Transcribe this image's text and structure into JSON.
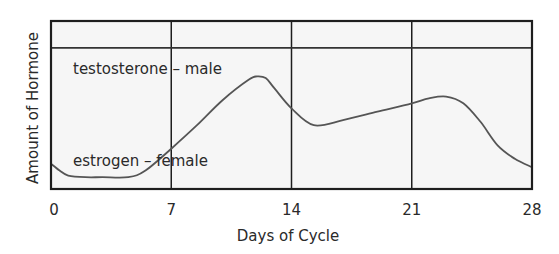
{
  "chart_data": {
    "type": "line",
    "title": "",
    "xlabel": "Days of Cycle",
    "ylabel": "Amount of Hormone",
    "xlim": [
      0,
      28
    ],
    "ylim": [
      0,
      100
    ],
    "x_ticks": [
      0,
      7,
      14,
      21,
      28
    ],
    "x_tick_labels": [
      "0",
      "7",
      "14",
      "21",
      "28"
    ],
    "y_ticks": [],
    "grid": {
      "vertical_at": [
        7,
        14,
        21
      ],
      "horizontal": false
    },
    "legend": null,
    "y_units_note": "relative (no numeric y scale shown)",
    "series": [
      {
        "name": "testosterone – male",
        "style": "horizontal line",
        "x": [
          0,
          28
        ],
        "values": [
          84,
          84
        ]
      },
      {
        "name": "estrogen – female",
        "style": "smooth curve",
        "x": [
          0,
          0.5,
          1,
          2,
          3,
          4.5,
          5.5,
          7,
          8.5,
          10,
          11.5,
          12,
          12.5,
          13,
          14,
          15.3,
          17,
          19,
          21,
          22,
          23,
          24,
          25,
          26,
          27,
          28
        ],
        "values": [
          15,
          11,
          8,
          7,
          7,
          7,
          11,
          24,
          38,
          53,
          65,
          67,
          66,
          60,
          48,
          38,
          41,
          46,
          51,
          54,
          55,
          51,
          40,
          26,
          18,
          13
        ]
      }
    ],
    "annotations": [
      {
        "text": "testosterone – male",
        "x": 1,
        "y": 75
      },
      {
        "text": "estrogen – female",
        "x": 1,
        "y": 12
      }
    ]
  },
  "labels": {
    "x_axis_title": "Days of Cycle",
    "y_axis_title": "Amount of Hormone",
    "x_ticks": [
      "0",
      "7",
      "14",
      "21",
      "28"
    ],
    "testosterone_label": "testosterone – male",
    "estrogen_label": "estrogen – female"
  },
  "colors": {
    "plot_background": "#f6f6f6",
    "axis": "#1e1e1e",
    "curve": "#555555",
    "text": "#2a2a2a"
  }
}
